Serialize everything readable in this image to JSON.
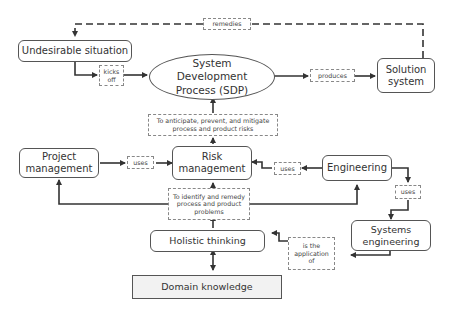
{
  "diagram": {
    "type": "concept-flow",
    "nodes": {
      "undesirable_situation": "Undesirable situation",
      "sdp_line1": "System",
      "sdp_line2": "Development",
      "sdp_line3": "Process (SDP)",
      "solution_line1": "Solution",
      "solution_line2": "system",
      "project_line1": "Project",
      "project_line2": "management",
      "risk_line1": "Risk",
      "risk_line2": "management",
      "engineering": "Engineering",
      "syseng_line1": "Systems",
      "syseng_line2": "engineering",
      "holistic": "Holistic thinking",
      "domain": "Domain knowledge"
    },
    "edge_labels": {
      "remedies": "remedies",
      "kicks_off_1": "kicks",
      "kicks_off_2": "off",
      "produces": "produces",
      "anticipate_1": "To anticipate, prevent, and mitigate",
      "anticipate_2": "process and product risks",
      "uses_pm": "uses",
      "uses_eng": "uses",
      "uses_se": "uses",
      "identify_1": "To identify and remedy",
      "identify_2": "process and product",
      "identify_3": "problems",
      "application_1": "is the",
      "application_2": "application",
      "application_3": "of"
    },
    "edges": [
      {
        "from": "Solution system",
        "to": "Undesirable situation",
        "label": "remedies",
        "style": "dashed"
      },
      {
        "from": "Undesirable situation",
        "to": "System Development Process (SDP)",
        "label": "kicks off"
      },
      {
        "from": "System Development Process (SDP)",
        "to": "Solution system",
        "label": "produces"
      },
      {
        "from": "Risk management",
        "to": "System Development Process (SDP)",
        "label": "To anticipate, prevent, and mitigate process and product risks"
      },
      {
        "from": "Project management",
        "to": "Risk management",
        "label": "uses"
      },
      {
        "from": "Engineering",
        "to": "Risk management",
        "label": "uses"
      },
      {
        "from": "Holistic thinking",
        "to": "Risk management",
        "label": "To identify and remedy process and product problems"
      },
      {
        "from": "Holistic thinking",
        "to": "Project management",
        "label": "To identify and remedy process and product problems"
      },
      {
        "from": "Holistic thinking",
        "to": "Engineering",
        "label": "To identify and remedy process and product problems"
      },
      {
        "from": "Engineering",
        "to": "Systems engineering",
        "label": "uses"
      },
      {
        "from": "Systems engineering",
        "to": "Holistic thinking",
        "label": "is the application of"
      },
      {
        "from": "Holistic thinking",
        "to": "Domain knowledge",
        "label": "",
        "style": "bidirectional"
      }
    ]
  }
}
